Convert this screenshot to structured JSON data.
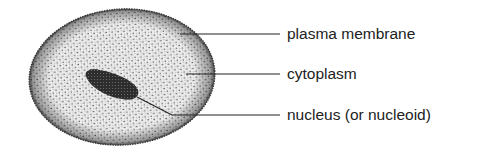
{
  "diagram": {
    "labels": [
      {
        "id": "plasma-membrane",
        "text": "plasma membrane",
        "x": 287,
        "y": 25,
        "line": {
          "x1": 180,
          "y1": 34,
          "x2": 280,
          "y2": 34
        }
      },
      {
        "id": "cytoplasm",
        "text": "cytoplasm",
        "x": 287,
        "y": 65,
        "line": {
          "x1": 186,
          "y1": 74,
          "x2": 280,
          "y2": 74
        }
      },
      {
        "id": "nucleus",
        "text": "nucleus (or nucleoid)",
        "x": 287,
        "y": 106,
        "line": {
          "x1": 172,
          "y1": 115,
          "x2": 280,
          "y2": 115
        }
      }
    ],
    "colors": {
      "cell_fill": "#e4e4e4",
      "stipple": "#3a3a3a",
      "nucleus": "#1e1e1e",
      "line": "#222222",
      "text": "#222222"
    }
  }
}
